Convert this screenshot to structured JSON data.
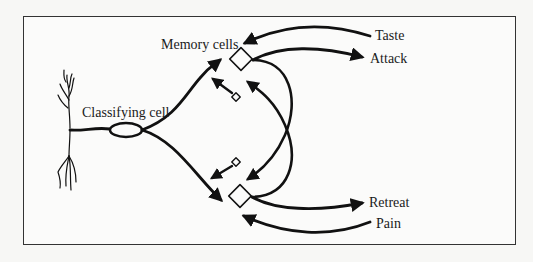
{
  "labels": {
    "memory_cells": "Memory cells",
    "classifying_cell": "Classifying cell",
    "taste": "Taste",
    "attack": "Attack",
    "retreat": "Retreat",
    "pain": "Pain"
  },
  "colors": {
    "stroke": "#111111",
    "frame": "#333333",
    "background": "#fbfbfa"
  }
}
